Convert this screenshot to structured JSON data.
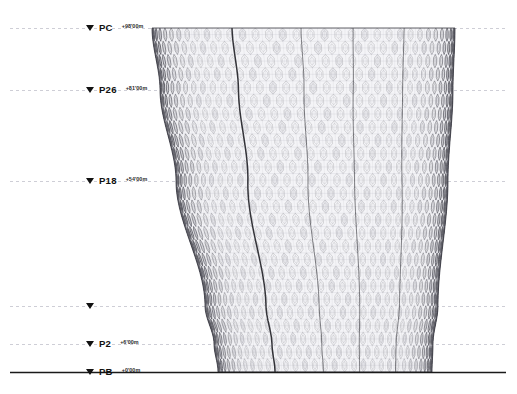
{
  "drawing": {
    "type": "architectural-elevation",
    "title": "Tower Elevation",
    "background_color": "#ffffff",
    "ground_line_color": "#1a1a1a",
    "datum_line_color": "#b9b9c4",
    "facade_line_color": "#4a4a52",
    "facade_fill_color": "#e8e8ec"
  },
  "levels": [
    {
      "marker": "triangle",
      "name": "PC",
      "elevation": "+98'00m",
      "y": 28,
      "has_label": true
    },
    {
      "marker": "triangle",
      "name": "P26",
      "elevation": "+81'00m",
      "y": 90,
      "has_label": true
    },
    {
      "marker": "triangle",
      "name": "P18",
      "elevation": "+54'00m",
      "y": 181,
      "has_label": true
    },
    {
      "marker": "triangle",
      "name": "",
      "elevation": "",
      "y": 306,
      "has_label": false
    },
    {
      "marker": "triangle",
      "name": "P2",
      "elevation": "+6'00m",
      "y": 344,
      "has_label": true
    },
    {
      "marker": "triangle",
      "name": "PB",
      "elevation": "+0'00m",
      "y": 372,
      "has_label": true
    }
  ],
  "datum_lines": {
    "x_start": 10,
    "x_end": 506,
    "dash": "3 3"
  },
  "ground": {
    "x_start": 10,
    "x_end": 506,
    "y": 372.5
  },
  "tower": {
    "top_y": 28,
    "base_y": 372,
    "left_edge": [
      [
        152,
        28
      ],
      [
        160,
        90
      ],
      [
        176,
        181
      ],
      [
        205,
        306
      ],
      [
        214,
        344
      ],
      [
        218,
        372
      ]
    ],
    "right_edge": [
      [
        455,
        28
      ],
      [
        453,
        90
      ],
      [
        448,
        181
      ],
      [
        438,
        306
      ],
      [
        433,
        344
      ],
      [
        432,
        372
      ]
    ],
    "seam_lines_x": [
      232,
      300,
      352,
      404
    ],
    "pattern": "hexagonal-diagrid",
    "columns": 34,
    "rows": 26
  }
}
